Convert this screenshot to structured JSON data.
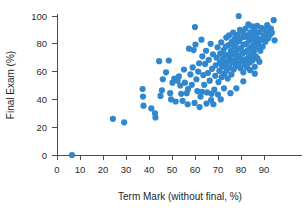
{
  "chart_data": {
    "type": "scatter",
    "title": "",
    "xlabel": "Term Mark (without final, %)",
    "ylabel": "Final Exam (%)",
    "xlim": [
      0,
      97
    ],
    "ylim": [
      0,
      104
    ],
    "xticks": [
      0,
      10,
      20,
      30,
      40,
      50,
      60,
      70,
      80,
      90
    ],
    "yticks": [
      0,
      20,
      40,
      60,
      80,
      100
    ],
    "xticklabels": [
      "0",
      "10",
      "20",
      "30",
      "40",
      "50",
      "60",
      "70",
      "80",
      "90"
    ],
    "yticklabels": [
      "0",
      "20",
      "40",
      "60",
      "80",
      "100"
    ],
    "grid": false,
    "legend": null,
    "marker_color": "#3087CE",
    "marker_size": 3.1,
    "axis_color": "#4d4d4d",
    "series": [
      {
        "name": "students",
        "points": [
          [
            6.5,
            0
          ],
          [
            24.3,
            26.0
          ],
          [
            29.2,
            23.5
          ],
          [
            37.2,
            47.5
          ],
          [
            37.4,
            42.0
          ],
          [
            37.6,
            35.5
          ],
          [
            41.0,
            33.5
          ],
          [
            42.6,
            30.0
          ],
          [
            42.8,
            27.0
          ],
          [
            44.4,
            67.5
          ],
          [
            45.0,
            42.5
          ],
          [
            45.6,
            46.5
          ],
          [
            47.4,
            59.5
          ],
          [
            48.6,
            68.0
          ],
          [
            49.2,
            44.5
          ],
          [
            49.6,
            40.0
          ],
          [
            51.0,
            55.0
          ],
          [
            51.6,
            38.5
          ],
          [
            52.4,
            53.5
          ],
          [
            53.0,
            56.5
          ],
          [
            53.6,
            50.0
          ],
          [
            54.0,
            44.0
          ],
          [
            54.6,
            39.0
          ],
          [
            55.2,
            61.5
          ],
          [
            55.6,
            52.0
          ],
          [
            56.4,
            44.5
          ],
          [
            56.8,
            36.5
          ],
          [
            57.4,
            76.5
          ],
          [
            58.0,
            58.0
          ],
          [
            58.6,
            50.5
          ],
          [
            59.0,
            63.0
          ],
          [
            59.4,
            75.5
          ],
          [
            60.0,
            92.0
          ],
          [
            60.2,
            79.5
          ],
          [
            60.6,
            54.5
          ],
          [
            61.0,
            46.0
          ],
          [
            61.4,
            60.0
          ],
          [
            61.8,
            66.0
          ],
          [
            62.4,
            42.0
          ],
          [
            62.8,
            83.0
          ],
          [
            63.2,
            71.0
          ],
          [
            63.6,
            57.5
          ],
          [
            64.0,
            50.5
          ],
          [
            64.4,
            65.5
          ],
          [
            64.8,
            75.0
          ],
          [
            65.2,
            45.0
          ],
          [
            65.6,
            59.0
          ],
          [
            66.0,
            68.5
          ],
          [
            66.4,
            53.5
          ],
          [
            66.8,
            80.0
          ],
          [
            67.0,
            39.5
          ],
          [
            67.4,
            62.0
          ],
          [
            67.8,
            72.5
          ],
          [
            68.0,
            36.5
          ],
          [
            68.4,
            47.0
          ],
          [
            68.8,
            57.0
          ],
          [
            69.0,
            64.5
          ],
          [
            69.4,
            70.0
          ],
          [
            69.8,
            77.5
          ],
          [
            70.0,
            43.5
          ],
          [
            70.2,
            52.5
          ],
          [
            70.6,
            60.5
          ],
          [
            70.8,
            66.5
          ],
          [
            71.0,
            73.0
          ],
          [
            71.4,
            81.0
          ],
          [
            71.6,
            56.0
          ],
          [
            71.8,
            63.5
          ],
          [
            72.0,
            69.0
          ],
          [
            72.4,
            75.5
          ],
          [
            72.6,
            48.0
          ],
          [
            72.8,
            58.5
          ],
          [
            73.0,
            65.0
          ],
          [
            73.2,
            71.5
          ],
          [
            73.4,
            78.0
          ],
          [
            73.6,
            84.5
          ],
          [
            73.8,
            61.0
          ],
          [
            74.0,
            67.0
          ],
          [
            74.2,
            55.0
          ],
          [
            74.4,
            72.0
          ],
          [
            74.6,
            79.0
          ],
          [
            74.8,
            86.0
          ],
          [
            75.0,
            63.0
          ],
          [
            75.2,
            69.5
          ],
          [
            75.4,
            44.5
          ],
          [
            75.6,
            75.0
          ],
          [
            75.8,
            58.0
          ],
          [
            76.0,
            81.5
          ],
          [
            76.2,
            66.5
          ],
          [
            76.4,
            72.5
          ],
          [
            76.6,
            88.0
          ],
          [
            76.8,
            61.5
          ],
          [
            77.0,
            78.0
          ],
          [
            77.2,
            68.0
          ],
          [
            77.4,
            84.0
          ],
          [
            77.6,
            73.5
          ],
          [
            77.8,
            64.0
          ],
          [
            78.0,
            80.5
          ],
          [
            78.2,
            70.0
          ],
          [
            78.4,
            86.5
          ],
          [
            78.6,
            76.0
          ],
          [
            78.8,
            66.0
          ],
          [
            79.0,
            100.0
          ],
          [
            79.2,
            82.0
          ],
          [
            79.4,
            71.5
          ],
          [
            79.6,
            90.0
          ],
          [
            79.8,
            62.5
          ],
          [
            80.0,
            77.0
          ],
          [
            80.2,
            84.5
          ],
          [
            80.4,
            68.5
          ],
          [
            80.6,
            73.0
          ],
          [
            80.8,
            88.5
          ],
          [
            81.0,
            59.5
          ],
          [
            81.2,
            79.5
          ],
          [
            81.4,
            65.5
          ],
          [
            81.6,
            85.0
          ],
          [
            81.8,
            74.0
          ],
          [
            82.0,
            91.0
          ],
          [
            82.2,
            69.0
          ],
          [
            82.4,
            80.0
          ],
          [
            82.6,
            63.0
          ],
          [
            82.8,
            86.0
          ],
          [
            83.0,
            75.5
          ],
          [
            83.2,
            94.0
          ],
          [
            83.4,
            70.5
          ],
          [
            83.6,
            82.5
          ],
          [
            83.8,
            66.5
          ],
          [
            84.0,
            88.0
          ],
          [
            84.2,
            77.0
          ],
          [
            84.4,
            72.0
          ],
          [
            84.6,
            84.0
          ],
          [
            84.8,
            92.5
          ],
          [
            85.0,
            68.0
          ],
          [
            85.2,
            79.0
          ],
          [
            85.4,
            86.5
          ],
          [
            85.6,
            74.5
          ],
          [
            85.8,
            90.0
          ],
          [
            86.0,
            63.5
          ],
          [
            86.2,
            82.0
          ],
          [
            86.4,
            71.0
          ],
          [
            86.6,
            87.5
          ],
          [
            86.8,
            77.5
          ],
          [
            87.0,
            93.0
          ],
          [
            87.2,
            69.5
          ],
          [
            87.4,
            84.0
          ],
          [
            87.6,
            80.0
          ],
          [
            88.0,
            88.5
          ],
          [
            88.4,
            75.0
          ],
          [
            88.8,
            91.5
          ],
          [
            89.0,
            83.0
          ],
          [
            89.4,
            78.0
          ],
          [
            89.8,
            86.0
          ],
          [
            90.2,
            90.5
          ],
          [
            90.6,
            81.5
          ],
          [
            91.0,
            87.0
          ],
          [
            91.4,
            93.5
          ],
          [
            91.8,
            84.0
          ],
          [
            92.2,
            89.0
          ],
          [
            92.6,
            86.5
          ],
          [
            93.0,
            91.0
          ],
          [
            93.4,
            88.0
          ],
          [
            94.2,
            97.0
          ],
          [
            94.6,
            82.5
          ],
          [
            62.0,
            34.5
          ],
          [
            57.0,
            47.5
          ],
          [
            50.2,
            52.0
          ],
          [
            46.0,
            54.5
          ],
          [
            59.8,
            37.5
          ],
          [
            65.0,
            37.0
          ],
          [
            71.2,
            40.0
          ],
          [
            67.2,
            44.0
          ],
          [
            63.0,
            45.5
          ],
          [
            86.0,
            58.5
          ],
          [
            88.0,
            67.0
          ],
          [
            84.0,
            61.0
          ],
          [
            81.0,
            53.0
          ],
          [
            78.0,
            48.0
          ]
        ]
      }
    ]
  }
}
